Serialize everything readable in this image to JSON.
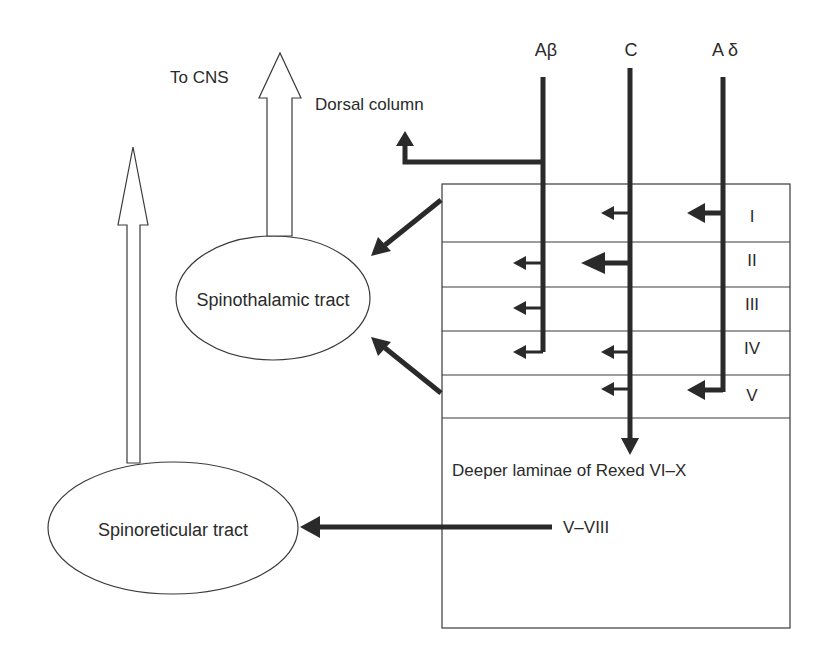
{
  "diagram": {
    "fibers": {
      "a_beta": "Aβ",
      "c": "C",
      "a_delta": "A δ"
    },
    "labels": {
      "to_cns": "To CNS",
      "dorsal_column": "Dorsal column",
      "spinothalamic": "Spinothalamic tract",
      "spinoreticular": "Spinoreticular tract",
      "deeper_laminae": "Deeper laminae of Rexed VI–X",
      "v_viii": "V–VIII"
    },
    "laminae": [
      "I",
      "II",
      "III",
      "IV",
      "V"
    ],
    "colors": {
      "ink": "#2a2a2a",
      "background": "#ffffff"
    }
  }
}
